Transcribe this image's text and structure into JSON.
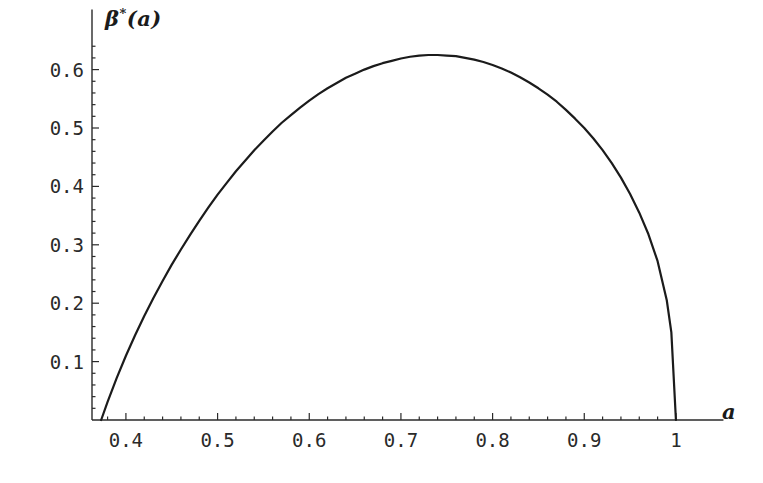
{
  "chart": {
    "type": "line",
    "y_axis_title_main": "β",
    "y_axis_title_sup": "*",
    "y_axis_title_arg": "(a)",
    "x_axis_title": "a",
    "background_color": "#ffffff",
    "curve_color": "#1b1b1b",
    "axis_color": "#2a2a2a"
  },
  "y_ticks": [
    {
      "label": "0.6",
      "value": 0.6
    },
    {
      "label": "0.5",
      "value": 0.5
    },
    {
      "label": "0.4",
      "value": 0.4
    },
    {
      "label": "0.3",
      "value": 0.3
    },
    {
      "label": "0.2",
      "value": 0.2
    },
    {
      "label": "0.1",
      "value": 0.1
    }
  ],
  "x_ticks": [
    {
      "label": "0.4",
      "value": 0.4
    },
    {
      "label": "0.5",
      "value": 0.5
    },
    {
      "label": "0.6",
      "value": 0.6
    },
    {
      "label": "0.7",
      "value": 0.7
    },
    {
      "label": "0.8",
      "value": 0.8
    },
    {
      "label": "0.9",
      "value": 0.9
    },
    {
      "label": "1",
      "value": 1.0
    }
  ],
  "chart_data": {
    "type": "line",
    "title": "",
    "subtitle": "",
    "xlabel": "a",
    "ylabel": "β*(a)",
    "xlim": [
      0.357,
      1.03
    ],
    "ylim": [
      0.0,
      0.655
    ],
    "grid": false,
    "legend": null,
    "x_tick_labels": [
      "0.4",
      "0.5",
      "0.6",
      "0.7",
      "0.8",
      "0.9",
      "1"
    ],
    "x_tick_values": [
      0.4,
      0.5,
      0.6,
      0.7,
      0.8,
      0.9,
      1.0
    ],
    "x_minor_tick_step": 0.02,
    "y_tick_labels": [
      "0.1",
      "0.2",
      "0.3",
      "0.4",
      "0.5",
      "0.6"
    ],
    "y_tick_values": [
      0.1,
      0.2,
      0.3,
      0.4,
      0.5,
      0.6
    ],
    "y_minor_tick_step": 0.02,
    "annotations": [],
    "series": [
      {
        "name": "β*(a)",
        "color": "#1b1b1b",
        "line_width": 2.2,
        "x": [
          0.373,
          0.38,
          0.39,
          0.4,
          0.41,
          0.42,
          0.43,
          0.44,
          0.45,
          0.46,
          0.47,
          0.48,
          0.49,
          0.5,
          0.51,
          0.52,
          0.53,
          0.54,
          0.55,
          0.56,
          0.57,
          0.58,
          0.59,
          0.6,
          0.61,
          0.62,
          0.63,
          0.64,
          0.65,
          0.66,
          0.67,
          0.68,
          0.69,
          0.7,
          0.71,
          0.72,
          0.73,
          0.74,
          0.75,
          0.76,
          0.77,
          0.78,
          0.79,
          0.8,
          0.81,
          0.82,
          0.83,
          0.84,
          0.85,
          0.86,
          0.87,
          0.88,
          0.89,
          0.9,
          0.91,
          0.92,
          0.93,
          0.94,
          0.95,
          0.96,
          0.97,
          0.98,
          0.99,
          0.995,
          1.0
        ],
        "y": [
          0.0,
          0.031,
          0.072,
          0.11,
          0.145,
          0.178,
          0.209,
          0.238,
          0.266,
          0.292,
          0.317,
          0.341,
          0.364,
          0.386,
          0.406,
          0.426,
          0.444,
          0.462,
          0.478,
          0.494,
          0.509,
          0.522,
          0.535,
          0.547,
          0.558,
          0.568,
          0.577,
          0.586,
          0.593,
          0.6,
          0.606,
          0.611,
          0.615,
          0.619,
          0.622,
          0.624,
          0.625,
          0.625,
          0.624,
          0.623,
          0.62,
          0.617,
          0.613,
          0.608,
          0.602,
          0.595,
          0.587,
          0.578,
          0.568,
          0.557,
          0.545,
          0.531,
          0.516,
          0.5,
          0.482,
          0.462,
          0.44,
          0.415,
          0.387,
          0.355,
          0.318,
          0.272,
          0.205,
          0.15,
          0.0
        ]
      }
    ],
    "peak": {
      "x": 0.735,
      "y": 0.625
    },
    "zeros": [
      0.373,
      1.0
    ]
  }
}
